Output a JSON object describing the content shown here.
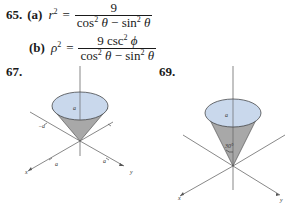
{
  "problems": [
    {
      "number": "65.",
      "parts": [
        {
          "label": "(a)",
          "lhs_var": "r",
          "lhs_exp": "2",
          "equals": "=",
          "numerator": "9",
          "denominator": {
            "term1_fn": "cos",
            "term1_exp": "2",
            "term1_var": "θ",
            "operator": "−",
            "term2_fn": "sin",
            "term2_exp": "2",
            "term2_var": "θ"
          }
        },
        {
          "label": "(b)",
          "lhs_var": "ρ",
          "lhs_exp": "2",
          "equals": "=",
          "numerator_coef": "9",
          "numerator_fn": "csc",
          "numerator_exp": "2",
          "numerator_var": "ϕ",
          "denominator": {
            "term1_fn": "cos",
            "term1_exp": "2",
            "term1_var": "θ",
            "operator": "−",
            "term2_fn": "sin",
            "term2_exp": "2",
            "term2_var": "θ"
          }
        }
      ]
    },
    {
      "number": "67.",
      "figure": {
        "type": "cone",
        "top_label": "a",
        "axis_labels": {
          "x": "x",
          "y": "y"
        },
        "tick_labels": {
          "neg_x": "−a",
          "x": "a",
          "y": "a"
        }
      }
    },
    {
      "number": "69.",
      "figure": {
        "type": "cone",
        "top_label": "a",
        "angle_label": "30°",
        "axis_labels": {
          "x": "x",
          "y": "y"
        }
      }
    }
  ],
  "colors": {
    "cone_top": "#c9d8ec",
    "cone_side": "#a8a8a8",
    "text": "#1a1a1a",
    "axis": "#555555"
  }
}
